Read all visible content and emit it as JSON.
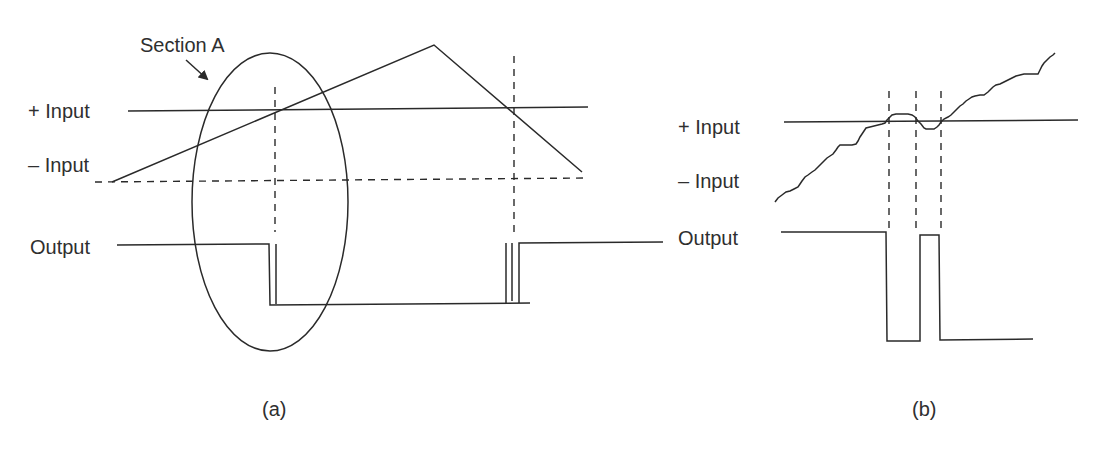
{
  "panel_a": {
    "caption": "(a)",
    "section_label": "Section A",
    "labels": {
      "plus_input": "+ Input",
      "minus_input": "– Input",
      "output": "Output"
    }
  },
  "panel_b": {
    "caption": "(b)",
    "labels": {
      "plus_input": "+ Input",
      "minus_input": "– Input",
      "output": "Output"
    }
  },
  "colors": {
    "line": "#2a2a2a",
    "text": "#2f2f2f",
    "background": "#ffffff"
  }
}
